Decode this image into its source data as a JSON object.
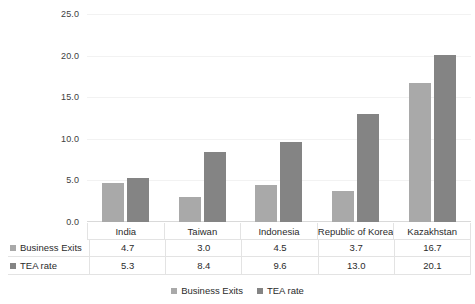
{
  "chart_data": {
    "type": "bar",
    "title": "",
    "subtitle": "",
    "xlabel": "",
    "ylabel": "",
    "categories": [
      "India",
      "Taiwan",
      "Indonesia",
      "Republic of Korea",
      "Kazakhstan"
    ],
    "series": [
      {
        "name": "Business Exits",
        "values": [
          4.7,
          3.0,
          4.5,
          3.7,
          16.7
        ],
        "color": "#a9a9a9"
      },
      {
        "name": "TEA rate",
        "values": [
          5.3,
          8.4,
          9.6,
          13.0,
          20.1
        ],
        "color": "#848484"
      }
    ],
    "ylim": [
      0,
      25
    ],
    "yticks": [
      0.0,
      5.0,
      10.0,
      15.0,
      20.0,
      25.0
    ],
    "ytick_labels": [
      "0.0",
      "5.0",
      "10.0",
      "15.0",
      "20.0",
      "25.0"
    ],
    "grid": true,
    "legend_position": "bottom",
    "data_table_visible": true
  },
  "legend": {
    "items": [
      {
        "label": "Business Exits",
        "color": "#a9a9a9"
      },
      {
        "label": "TEA rate",
        "color": "#848484"
      }
    ]
  }
}
